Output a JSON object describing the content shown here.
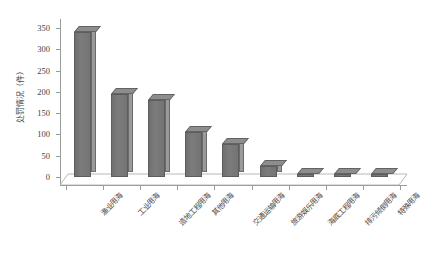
{
  "chart_data": {
    "type": "bar",
    "title": "",
    "subtitle": "",
    "xlabel": "",
    "ylabel": "处罚情况（件）",
    "ylim": [
      0,
      350
    ],
    "ytick_step": 50,
    "yticks": [
      0,
      50,
      100,
      150,
      200,
      250,
      300,
      350
    ],
    "ytick_labels": [
      "0",
      "50",
      "100",
      "150",
      "200",
      "250",
      "300",
      "350"
    ],
    "grid": false,
    "legend": false,
    "legend_position": "none",
    "style": "3d-column",
    "bar_color": "#7a7a7a",
    "bar_side_color": "#9a9a9a",
    "bar_top_color": "#8d8d8d",
    "axis_color": "#9a9a9a",
    "categories": [
      "渔业用海",
      "工业用海",
      "造地工程用海",
      "其他用海",
      "交通运输用海",
      "旅游娱乐用海",
      "海底工程用海",
      "排污倾倒用海",
      "特殊用海"
    ],
    "values": [
      340,
      195,
      180,
      105,
      78,
      25,
      5,
      5,
      5
    ],
    "series": [
      {
        "name": "处罚情况",
        "values": [
          340,
          195,
          180,
          105,
          78,
          25,
          5,
          5,
          5
        ]
      }
    ]
  }
}
